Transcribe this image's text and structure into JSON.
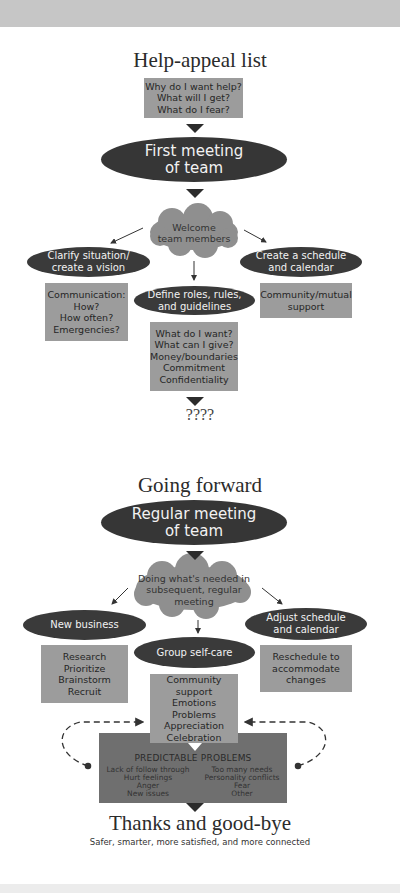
{
  "section1": {
    "title": "Help-appeal list",
    "intro_box": [
      "Why do I want help?",
      "What will I get?",
      "What do I fear?"
    ],
    "first_meeting": [
      "First meeting",
      "of team"
    ],
    "welcome_cloud": [
      "Welcome",
      "team members"
    ],
    "branches": {
      "left": {
        "ellipse": [
          "Clarify situation/",
          "create a vision"
        ],
        "box": [
          "Communication:",
          "How?",
          "How often?",
          "Emergencies?"
        ]
      },
      "center": {
        "ellipse": [
          "Define roles, rules,",
          "and guidelines"
        ],
        "box": [
          "What do I want?",
          "What can I give?",
          "Money/boundaries",
          "Commitment",
          "Confidentiality"
        ]
      },
      "right": {
        "ellipse": [
          "Create a schedule",
          "and calendar"
        ],
        "box": [
          "Community/mutual",
          "support"
        ]
      }
    },
    "outcome": "????"
  },
  "section2": {
    "title": "Going forward",
    "regular_meeting": [
      "Regular meeting",
      "of team"
    ],
    "doing_cloud": [
      "Doing what's needed in",
      "subsequent, regular",
      "meeting"
    ],
    "branches": {
      "left": {
        "ellipse": [
          "New business"
        ],
        "box": [
          "Research",
          "Prioritize",
          "Brainstorm",
          "Recruit"
        ]
      },
      "center": {
        "ellipse": [
          "Group self-care"
        ],
        "box": [
          "Community support",
          "Emotions",
          "Problems",
          "Appreciation",
          "Celebration"
        ]
      },
      "right": {
        "ellipse": [
          "Adjust schedule",
          "and calendar"
        ],
        "box": [
          "Reschedule to",
          "accommodate",
          "changes"
        ]
      }
    },
    "predictable_problems": {
      "title": "PREDICTABLE PROBLEMS",
      "left_column": [
        "Lack of follow through",
        "Hurt feelings",
        "Anger",
        "New issues"
      ],
      "right_column": [
        "Too many needs",
        "Personality conflicts",
        "Fear",
        "Other"
      ]
    },
    "closing_title": "Thanks and good-bye",
    "closing_subtitle": "Safer, smarter, more satisfied, and more connected"
  },
  "colors": {
    "ellipse": "#3a3a3a",
    "box": "#9c9c9c",
    "cloud": "#8f8f8f",
    "problems_box": "#6f6f6f",
    "band": "#c6c6c6"
  }
}
